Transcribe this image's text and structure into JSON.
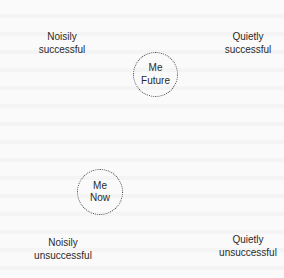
{
  "quadrants": {
    "top_left": {
      "line1": "Noisily",
      "line2": "successful"
    },
    "top_right": {
      "line1": "Quietly",
      "line2": "successful"
    },
    "bottom_left": {
      "line1": "Noisily",
      "line2": "unsuccessful"
    },
    "bottom_right": {
      "line1": "Quietly",
      "line2": "unsuccessful"
    }
  },
  "nodes": {
    "future": {
      "line1": "Me",
      "line2": "Future"
    },
    "now": {
      "line1": "Me",
      "line2": "Now"
    }
  },
  "colors": {
    "text": "#2a2a2a",
    "circle_border": "#444444",
    "background": "#fafafa"
  }
}
